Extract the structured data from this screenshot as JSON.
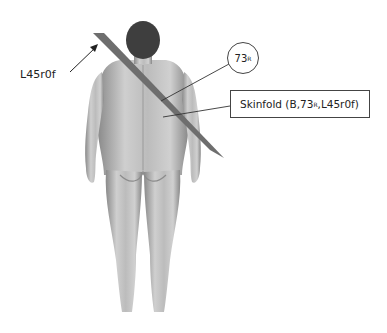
{
  "diagram": {
    "figure": "human-body-posterior-view",
    "site_label": "L45r0f",
    "site_circle": {
      "number": "73",
      "subscript": "R"
    },
    "result_box": {
      "prefix": "Skinfold (B,",
      "number": "73",
      "subscript": "R",
      "suffix": ",L45r0f)"
    }
  },
  "colors": {
    "band": "#6e6e6e",
    "line": "#333333",
    "skin": "#bdbdbd"
  }
}
